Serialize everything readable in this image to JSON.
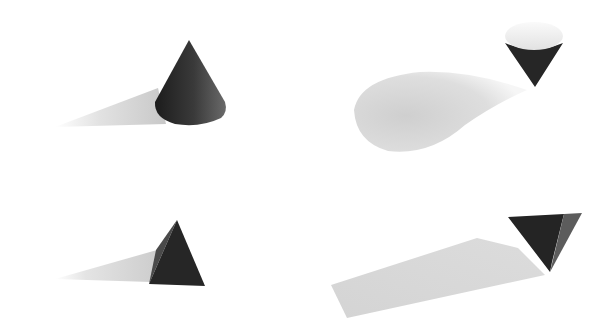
{
  "scene": {
    "description": "Four 3D-rendered geometric solids with cast shadows on a white background",
    "background_color": "#ffffff",
    "objects": [
      {
        "id": "upright-cone",
        "shape": "cone",
        "orientation": "upright",
        "position": "top-left",
        "shadow": "long tapered shadow extending left"
      },
      {
        "id": "inverted-cone",
        "shape": "cone",
        "orientation": "inverted (balanced on tip)",
        "position": "top-right",
        "shadow": "teardrop/elliptical shadow extending left"
      },
      {
        "id": "upright-pyramid",
        "shape": "pyramid",
        "orientation": "upright",
        "position": "bottom-left",
        "shadow": "tapered triangular shadow extending left"
      },
      {
        "id": "inverted-pyramid",
        "shape": "pyramid",
        "orientation": "inverted (balanced on tip)",
        "position": "bottom-right",
        "shadow": "wide trapezoidal shadow extending left"
      }
    ],
    "colors": {
      "solid_dark": "#2a2a2a",
      "solid_mid": "#555555",
      "cone_top_light": "#f4f4f4",
      "shadow": "#d6d6d6"
    }
  }
}
